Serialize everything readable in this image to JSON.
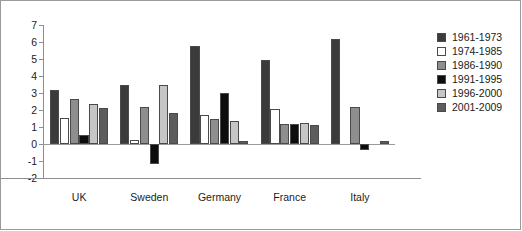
{
  "chart_data": {
    "type": "bar",
    "title": "",
    "xlabel": "",
    "ylabel": "",
    "ylim": [
      -2,
      7
    ],
    "yticks": [
      7,
      6,
      5,
      4,
      3,
      2,
      1,
      0,
      -1,
      -2
    ],
    "ytick_labels": [
      "7",
      "6",
      "5",
      "4",
      "3",
      "2",
      "1",
      "0",
      "-1",
      "-2"
    ],
    "grid": false,
    "legend_position": "right",
    "categories": [
      "UK",
      "Sweden",
      "Germany",
      "France",
      "Italy"
    ],
    "series": [
      {
        "name": "1961-1973",
        "color": "#3b3b3b",
        "values": [
          3.2,
          3.45,
          5.75,
          4.95,
          6.2
        ]
      },
      {
        "name": "1974-1985",
        "color": "#ffffff",
        "values": [
          1.55,
          0.25,
          1.7,
          2.05,
          0.0
        ]
      },
      {
        "name": "1986-1990",
        "color": "#8e8e8e",
        "values": [
          2.65,
          2.15,
          1.5,
          1.15,
          2.2
        ]
      },
      {
        "name": "1991-1995",
        "color": "#0d0d0d",
        "values": [
          0.55,
          -1.2,
          3.0,
          1.2,
          -0.35
        ]
      },
      {
        "name": "1996-2000",
        "color": "#c6c6c6",
        "values": [
          2.35,
          3.45,
          1.35,
          1.25,
          0.0
        ]
      },
      {
        "name": "2001-2009",
        "color": "#5c5c5c",
        "values": [
          2.1,
          1.8,
          0.15,
          1.1,
          0.2
        ]
      }
    ]
  },
  "legend": {
    "items": [
      {
        "label": "1961-1973"
      },
      {
        "label": "1974-1985"
      },
      {
        "label": "1986-1990"
      },
      {
        "label": "1991-1995"
      },
      {
        "label": "1996-2000"
      },
      {
        "label": "2001-2009"
      }
    ]
  },
  "colors": {
    "axis": "#8d8d8d",
    "frame": "#9a9a9a",
    "text": "#1c1c1c",
    "bar_outline": "#4a4a4a",
    "background": "#ffffff"
  }
}
